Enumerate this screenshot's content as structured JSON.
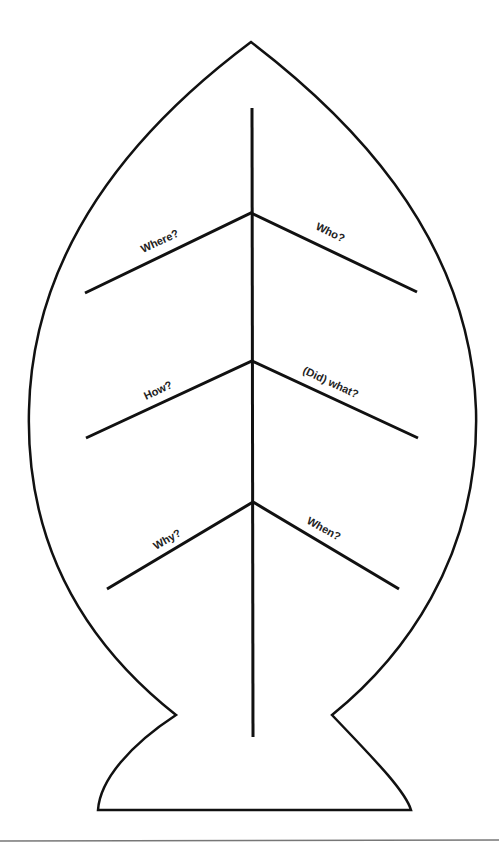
{
  "diagram": {
    "type": "fishbone",
    "labels": {
      "where": "Where?",
      "who": "Who?",
      "how": "How?",
      "did_what": "(Did) what?",
      "why": "Why?",
      "when": "When?"
    },
    "colors": {
      "stroke": "#111111",
      "text": "#222222",
      "background": "#ffffff",
      "divider": "#777777"
    }
  }
}
